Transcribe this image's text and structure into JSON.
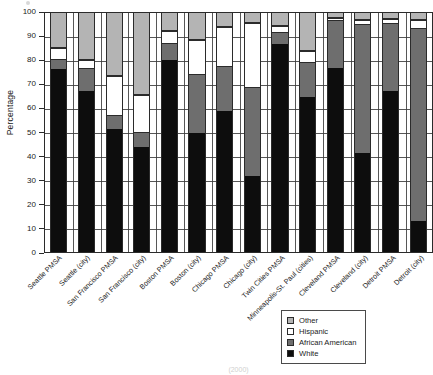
{
  "chart_data": {
    "type": "bar",
    "subtype": "stacked-bar-100-percent",
    "title": "",
    "xlabel": "",
    "ylabel": "Percentage",
    "ylim": [
      0,
      100
    ],
    "ytick_step": 10,
    "yticks": [
      0,
      10,
      20,
      30,
      40,
      50,
      60,
      70,
      80,
      90,
      100
    ],
    "grid": "horizontal",
    "legend_position": "bottom-right",
    "stack_order_bottom_to_top": [
      "White",
      "African American",
      "Hispanic",
      "Other"
    ],
    "categories": [
      "Seattle PMSA",
      "Seattle (city)",
      "San Francisco PMSA",
      "San Francisco (city)",
      "Boston PMSA",
      "Boston (city)",
      "Chicago PMSA",
      "Chicago (city)",
      "Twin Cities PMSA",
      "Minneapolis-St. Paul (cities)",
      "Cleveland PMSA",
      "Cleveland (city)",
      "Detroit PMSA",
      "Detroit (city)"
    ],
    "series": [
      {
        "name": "White",
        "color": "#0d0d0d",
        "values": [
          76.5,
          67.5,
          51.5,
          44.0,
          80.5,
          50.0,
          59.0,
          32.0,
          87.0,
          65.0,
          77.0,
          41.5,
          67.5,
          13.0
        ]
      },
      {
        "name": "African American",
        "color": "#6e6e6e",
        "values": [
          4.0,
          9.0,
          5.5,
          6.0,
          6.5,
          24.0,
          18.5,
          36.5,
          4.5,
          14.0,
          19.5,
          53.5,
          28.0,
          80.5
        ]
      },
      {
        "name": "Hispanic",
        "color": "#ffffff",
        "values": [
          5.0,
          4.0,
          16.5,
          15.5,
          5.5,
          14.5,
          16.5,
          27.5,
          3.0,
          5.0,
          1.5,
          2.0,
          2.0,
          3.5
        ]
      },
      {
        "name": "Other",
        "color": "#b4b4b4",
        "values": [
          14.5,
          19.5,
          26.5,
          34.5,
          7.5,
          11.5,
          6.0,
          4.0,
          5.5,
          16.0,
          2.0,
          3.0,
          2.5,
          3.0
        ]
      }
    ],
    "cumulative_tops": [
      {
        "category": "Seattle PMSA",
        "white": 76.5,
        "african_american": 80.5,
        "hispanic": 85.5,
        "other": 100
      },
      {
        "category": "Seattle (city)",
        "white": 67.5,
        "african_american": 76.5,
        "hispanic": 80.5,
        "other": 100
      },
      {
        "category": "San Francisco PMSA",
        "white": 51.5,
        "african_american": 57.0,
        "hispanic": 73.5,
        "other": 100
      },
      {
        "category": "San Francisco (city)",
        "white": 44.0,
        "african_american": 50.0,
        "hispanic": 65.5,
        "other": 100
      },
      {
        "category": "Boston PMSA",
        "white": 80.5,
        "african_american": 87.0,
        "hispanic": 92.5,
        "other": 100
      },
      {
        "category": "Boston (city)",
        "white": 50.0,
        "african_american": 74.0,
        "hispanic": 88.5,
        "other": 100
      },
      {
        "category": "Chicago PMSA",
        "white": 59.0,
        "african_american": 77.5,
        "hispanic": 94.0,
        "other": 100
      },
      {
        "category": "Chicago (city)",
        "white": 32.0,
        "african_american": 68.5,
        "hispanic": 96.0,
        "other": 100
      },
      {
        "category": "Twin Cities PMSA",
        "white": 87.0,
        "african_american": 91.5,
        "hispanic": 94.5,
        "other": 100
      },
      {
        "category": "Minneapolis-St. Paul (cities)",
        "white": 65.0,
        "african_american": 79.0,
        "hispanic": 84.0,
        "other": 100
      },
      {
        "category": "Cleveland PMSA",
        "white": 77.0,
        "african_american": 96.5,
        "hispanic": 98.0,
        "other": 100
      },
      {
        "category": "Cleveland (city)",
        "white": 41.5,
        "african_american": 95.0,
        "hispanic": 97.0,
        "other": 100
      },
      {
        "category": "Detroit PMSA",
        "white": 67.5,
        "african_american": 95.5,
        "hispanic": 97.5,
        "other": 100
      },
      {
        "category": "Detroit (city)",
        "white": 13.0,
        "african_american": 93.5,
        "hispanic": 97.0,
        "other": 100
      }
    ]
  },
  "legend": {
    "items": [
      {
        "label": "Other",
        "swatch": "other-swatch"
      },
      {
        "label": "Hispanic",
        "swatch": "hispanic-swatch"
      },
      {
        "label": "African American",
        "swatch": "african-american-swatch"
      },
      {
        "label": "White",
        "swatch": "white-swatch"
      }
    ]
  },
  "caption": "(2000)"
}
